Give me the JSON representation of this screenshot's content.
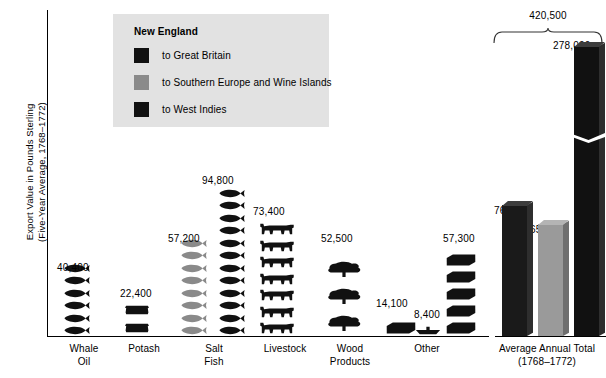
{
  "chart_data": {
    "type": "bar",
    "title": "",
    "ylabel": "Export Value in Pounds Sterling (Five-Year Average, 1768–1772)",
    "ylabel_line1": "Export Value in Pounds Sterling",
    "ylabel_line2": "(Five-Year Average, 1768–1772)",
    "xlabel": "",
    "grid": false,
    "legend_position": "top-left",
    "legend_title": "New England",
    "series": [
      {
        "name": "to Great Britain",
        "color": "#111111"
      },
      {
        "name": "to Southern Europe and Wine Islands",
        "color": "#8a8a8a"
      },
      {
        "name": "to West Indies",
        "color": "#111111"
      }
    ],
    "categories": [
      "Whale Oil",
      "Potash",
      "Salt Fish",
      "Livestock",
      "Wood Products",
      "Other",
      "Average Annual Total (1768–1772)"
    ],
    "pictogram_groups": [
      {
        "category": "Whale Oil",
        "label_lines": [
          "Whale",
          "Oil"
        ],
        "left": 57,
        "width": 54,
        "entries": [
          {
            "value": 40400,
            "value_label": "40,400",
            "series": "to Great Britain",
            "color": "#111111",
            "icon": "whale-icon",
            "icon_count": 6,
            "label_x": 57,
            "label_y": 262
          }
        ]
      },
      {
        "category": "Potash",
        "label_lines": [
          "Potash"
        ],
        "left": 120,
        "width": 48,
        "entries": [
          {
            "value": 22400,
            "value_label": "22,400",
            "series": "to Great Britain",
            "color": "#111111",
            "icon": "barrel-icon",
            "icon_count": 2,
            "label_x": 120,
            "label_y": 288
          }
        ]
      },
      {
        "category": "Salt Fish",
        "label_lines": [
          "Salt",
          "Fish"
        ],
        "left": 176,
        "width": 76,
        "entries": [
          {
            "value": 57200,
            "value_label": "57,200",
            "series": "to Southern Europe and Wine Islands",
            "color": "#8a8a8a",
            "icon": "fish-icon",
            "icon_count": 8,
            "label_x": 168,
            "label_y": 233
          },
          {
            "value": 94800,
            "value_label": "94,800",
            "series": "to West Indies",
            "color": "#111111",
            "icon": "fish-icon",
            "icon_count": 12,
            "label_x": 202,
            "label_y": 175
          }
        ]
      },
      {
        "category": "Livestock",
        "label_lines": [
          "Livestock"
        ],
        "left": 256,
        "width": 58,
        "entries": [
          {
            "value": 73400,
            "value_label": "73,400",
            "series": "to West Indies",
            "color": "#111111",
            "icon": "cow-icon",
            "icon_count": 7,
            "label_x": 253,
            "label_y": 206
          }
        ]
      },
      {
        "category": "Wood Products",
        "label_lines": [
          "Wood",
          "Products"
        ],
        "left": 322,
        "width": 56,
        "entries": [
          {
            "value": 52500,
            "value_label": "52,500",
            "series": "to West Indies",
            "color": "#111111",
            "icon": "tree-icon",
            "icon_count": 3,
            "label_x": 321,
            "label_y": 233
          }
        ]
      },
      {
        "category": "Other",
        "label_lines": [
          "Other"
        ],
        "left": 382,
        "width": 90,
        "entries": [
          {
            "value": 14100,
            "value_label": "14,100",
            "series": "to Great Britain",
            "color": "#111111",
            "icon": "crate-icon",
            "icon_count": 1,
            "label_x": 376,
            "label_y": 298
          },
          {
            "value": 8400,
            "value_label": "8,400",
            "series": "to Southern Europe and Wine Islands",
            "color": "#111111",
            "icon": "boat-icon",
            "icon_count": 1,
            "label_x": 414,
            "label_y": 309
          },
          {
            "value": 57300,
            "value_label": "57,300",
            "series": "to West Indies",
            "color": "#111111",
            "icon": "crate-icon",
            "icon_count": 5,
            "label_x": 443,
            "label_y": 233
          }
        ]
      }
    ],
    "bars": [
      {
        "name": "to Great Britain",
        "value": 76900,
        "value_label": "76,900",
        "color": "#1a1a1a",
        "left": 502,
        "width": 25,
        "height": 131,
        "label_x": 494,
        "label_y": 205,
        "broken": false
      },
      {
        "name": "to Southern Europe and Wine Islands",
        "value": 65600,
        "value_label": "65,600",
        "color": "#9a9a9a",
        "left": 538,
        "width": 25,
        "height": 112,
        "label_x": 530,
        "label_y": 224,
        "broken": false
      },
      {
        "name": "to West Indies",
        "value": 278000,
        "value_label": "278,000",
        "color": "#111111",
        "left": 574,
        "width": 25,
        "height": 290,
        "label_x": 553,
        "label_y": 40,
        "broken": true,
        "break_offset": 196
      }
    ],
    "total_annotation": {
      "value": 420500,
      "value_label": "420,500",
      "brace_label": "Average Annual Total (1768–1772)",
      "brace_line1": "Average Annual Total",
      "brace_line2": "(1768–1772)"
    }
  }
}
